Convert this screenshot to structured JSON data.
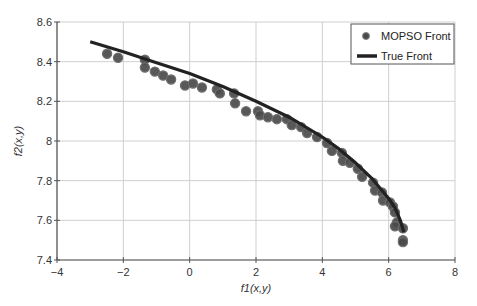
{
  "chart_data": {
    "type": "scatter",
    "title": "",
    "xlabel": "f1(x,y)",
    "ylabel": "f2(x,y)",
    "xlim": [
      -4,
      8
    ],
    "ylim": [
      7.4,
      8.6
    ],
    "xticks": [
      -4,
      -2,
      0,
      2,
      4,
      6,
      8
    ],
    "yticks": [
      7.4,
      7.6,
      7.8,
      8,
      8.2,
      8.4,
      8.6
    ],
    "xtick_labels": [
      "−4",
      "−2",
      "0",
      "2",
      "4",
      "6",
      "8"
    ],
    "ytick_labels": [
      "7.4",
      "7.6",
      "7.8",
      "8",
      "8.2",
      "8.4",
      "8.6"
    ],
    "grid": true,
    "legend_position": "upper right",
    "series": [
      {
        "name": "MOPSO Front",
        "kind": "scatter",
        "color": "#4a4a4a",
        "edge_color": "#6e6e6e",
        "x": [
          -2.49,
          -2.16,
          -1.35,
          -1.35,
          -1.05,
          -0.8,
          -0.56,
          -0.14,
          0.1,
          0.37,
          0.82,
          0.91,
          1.34,
          1.37,
          1.7,
          2.06,
          2.12,
          2.36,
          2.63,
          2.93,
          3.08,
          3.36,
          3.54,
          3.84,
          4.14,
          4.29,
          4.59,
          4.62,
          4.83,
          5.07,
          5.2,
          5.53,
          5.59,
          5.8,
          5.83,
          6.04,
          6.13,
          6.19,
          6.25,
          6.19,
          6.43,
          6.43,
          6.43
        ],
        "y": [
          8.44,
          8.42,
          8.41,
          8.37,
          8.35,
          8.33,
          8.31,
          8.28,
          8.29,
          8.27,
          8.26,
          8.24,
          8.24,
          8.19,
          8.15,
          8.15,
          8.13,
          8.12,
          8.11,
          8.11,
          8.08,
          8.07,
          8.04,
          8.02,
          7.99,
          7.95,
          7.94,
          7.9,
          7.89,
          7.86,
          7.82,
          7.79,
          7.75,
          7.74,
          7.7,
          7.69,
          7.67,
          7.64,
          7.59,
          7.57,
          7.56,
          7.5,
          7.49
        ]
      },
      {
        "name": "True Front",
        "kind": "line",
        "color": "#222222",
        "x": [
          -3.0,
          -2.0,
          -1.0,
          0.0,
          1.0,
          2.0,
          3.0,
          4.0,
          4.5,
          5.0,
          5.5,
          6.0,
          6.2,
          6.35,
          6.46
        ],
        "y": [
          8.5,
          8.45,
          8.395,
          8.34,
          8.275,
          8.2,
          8.12,
          8.02,
          7.96,
          7.89,
          7.81,
          7.71,
          7.66,
          7.6,
          7.54
        ]
      }
    ]
  },
  "legend": {
    "items": [
      {
        "label": "MOPSO Front",
        "symbol": "marker"
      },
      {
        "label": "True Front",
        "symbol": "line"
      }
    ]
  },
  "axes": {
    "xlabel": "f1(x,y)",
    "ylabel": "f2(x,y)"
  },
  "colors": {
    "grid": "#cfcfcf",
    "axis": "#555555",
    "marker_fill": "#4a4a4a",
    "line": "#222222"
  }
}
